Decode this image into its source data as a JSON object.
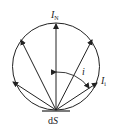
{
  "diagram": {
    "labels": {
      "normal_intensity": "I",
      "normal_intensity_sub": "N",
      "angle": "i",
      "angled_intensity": "I",
      "angled_intensity_sub": "i",
      "surface_element_d": "d",
      "surface_element_S": "S"
    },
    "colors": {
      "stroke": "#222222",
      "background": "#ffffff"
    },
    "circle": {
      "cx": 56,
      "cy": 66.5,
      "r": 44
    },
    "origin": {
      "x": 56,
      "y": 110
    },
    "arrows": [
      {
        "name": "normal",
        "x": 56,
        "y": 23
      },
      {
        "name": "upper-left",
        "x": 21,
        "y": 40
      },
      {
        "name": "lower-left",
        "x": 13,
        "y": 82
      },
      {
        "name": "upper-right",
        "x": 92,
        "y": 40
      },
      {
        "name": "lower-right-Ii",
        "x": 97,
        "y": 83
      }
    ]
  }
}
